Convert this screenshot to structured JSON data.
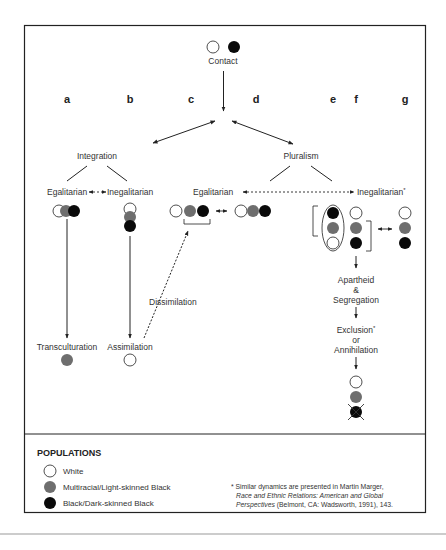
{
  "diagram": {
    "contact_label": "Contact",
    "columns": [
      "a",
      "b",
      "c",
      "d",
      "e",
      "f",
      "g"
    ],
    "integration": {
      "label": "Integration",
      "egalitarian": "Egalitarian",
      "inegalitarian": "Inegalitarian",
      "outcome_a": "Transculturation",
      "outcome_b": "Assimilation"
    },
    "pluralism": {
      "label": "Pluralism",
      "egalitarian": "Egalitarian",
      "inegalitarian": "Inegalitarian",
      "inegalitarian_mark": "*"
    },
    "dissimilation_label": "Dissimilation",
    "apartheid": {
      "line1": "Apartheid",
      "line2": "&",
      "line3": "Segregation"
    },
    "exclusion": {
      "line1": "Exclusion",
      "mark": "*",
      "line2": "or",
      "line3": "Annihilation"
    },
    "colors": {
      "white": "#ffffff",
      "multiracial": "#6e6e6e",
      "black": "#0a0a0a",
      "stroke": "#222222"
    }
  },
  "legend": {
    "title": "POPULATIONS",
    "items": [
      {
        "label": "White",
        "color": "#ffffff"
      },
      {
        "label": "Multiracial/Light-skinned Black",
        "color": "#6e6e6e"
      },
      {
        "label": "Black/Dark-skinned Black",
        "color": "#0a0a0a"
      }
    ],
    "footnote": {
      "line1": "* Similar dynamics are presented in Martin Marger,",
      "line2_italic": "Race and Ethnic Relations: American and Global",
      "line3_italic": "Perspectives",
      "line3_rest": " (Belmont, CA: Wadsworth, 1991), 143."
    }
  }
}
